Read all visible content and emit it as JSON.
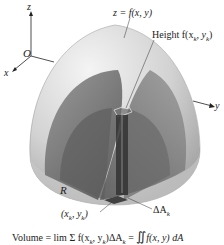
{
  "diagram": {
    "axes": {
      "z_label": "z",
      "x_label": "x",
      "y_label": "y",
      "origin_label": "O"
    },
    "labels": {
      "surface": "z = f(x, y)",
      "height": "Height f(x",
      "height_sub": "k",
      "height_mid": ", y",
      "height_sub2": "k",
      "height_end": ")",
      "region": "R",
      "point": "(x",
      "point_sub": "k",
      "point_mid": ", y",
      "point_sub2": "k",
      "point_end": ")",
      "area": "ΔA",
      "area_sub": "k"
    },
    "formula": {
      "prefix": "Volume = lim Σ f(x",
      "sub1": "k",
      "mid1": ", y",
      "sub2": "k",
      "mid2": ")ΔA",
      "sub3": "k",
      "mid3": " = ",
      "integral": "∬",
      "integrand": "f(x, y) dA"
    },
    "colors": {
      "shell_light": "#e6e6e6",
      "shell_mid": "#bdbdbd",
      "shell_dark": "#7a7a7a",
      "slab_dark": "#3c3c3c",
      "text": "#222222"
    }
  }
}
